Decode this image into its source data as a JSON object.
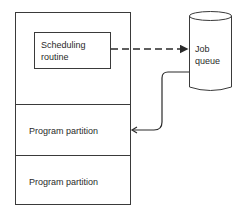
{
  "diagram": {
    "memory": {
      "scheduler_label_line1": "Scheduling",
      "scheduler_label_line2": "routine",
      "partitions": [
        {
          "label": "Program partition"
        },
        {
          "label": "Program partition"
        }
      ]
    },
    "job_queue": {
      "label_line1": "Job",
      "label_line2": "queue"
    },
    "colors": {
      "stroke": "#3a3a3a",
      "text": "#2a2a2a"
    }
  }
}
